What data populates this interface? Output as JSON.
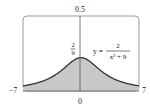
{
  "chart_data": {
    "type": "area",
    "title": "",
    "function": "y = 2/(x^2 + 9)",
    "equation_label": {
      "lhs": "y =",
      "numerator": "2",
      "denominator": "x² + 9"
    },
    "peak_label": {
      "numerator": "2",
      "denominator": "9"
    },
    "xlim": [
      -7,
      7
    ],
    "ylim": [
      0,
      0.5
    ],
    "x_tick_labels": [
      "−7",
      "0",
      "7"
    ],
    "y_tick_labels": [
      "0.5"
    ],
    "shaded_region": {
      "from": -7,
      "to": 7,
      "color": "#c8c8c8"
    },
    "curve_color": "#333333",
    "x": [
      -7,
      -6,
      -5,
      -4,
      -3,
      -2,
      -1,
      0,
      1,
      2,
      3,
      4,
      5,
      6,
      7
    ],
    "values": [
      0.0345,
      0.0444,
      0.0588,
      0.08,
      0.1111,
      0.1538,
      0.2,
      0.2222,
      0.2,
      0.1538,
      0.1111,
      0.08,
      0.0588,
      0.0444,
      0.0345
    ],
    "grid": false,
    "legend": "none"
  }
}
